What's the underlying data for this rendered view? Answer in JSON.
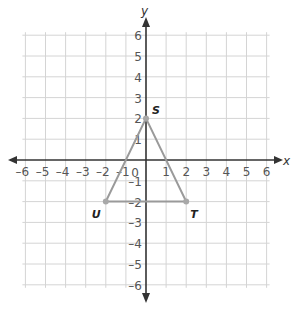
{
  "diagram": {
    "type": "coordinate-plane",
    "axes": {
      "x_label": "x",
      "y_label": "y",
      "x_range": [
        -6,
        6
      ],
      "y_range": [
        -6,
        6
      ],
      "origin_label": "0",
      "x_ticks": [
        "-6",
        "-5",
        "-4",
        "-3",
        "-2",
        "-1",
        "1",
        "2",
        "3",
        "4",
        "5",
        "6"
      ],
      "y_ticks": [
        "6",
        "5",
        "4",
        "3",
        "2",
        "1",
        "-1",
        "-2",
        "-3",
        "-4",
        "-5",
        "-6"
      ]
    },
    "triangle": {
      "vertices": [
        {
          "label": "S",
          "x": 0,
          "y": 2
        },
        {
          "label": "T",
          "x": 2,
          "y": -2
        },
        {
          "label": "U",
          "x": -2,
          "y": -2
        }
      ]
    },
    "colors": {
      "grid": "#d4d4d4",
      "axis": "#333333",
      "triangle": "#9a9a9a",
      "vertex": "#a8a8a8"
    }
  }
}
